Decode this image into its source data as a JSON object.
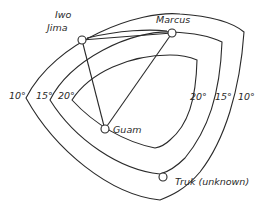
{
  "diagram": {
    "type": "isoline-map",
    "contours": [
      {
        "label": "10°",
        "left_label": "10°",
        "right_label": "10°"
      },
      {
        "label": "15°",
        "left_label": "15°",
        "right_label": "15°"
      },
      {
        "label": "20°",
        "left_label": "20°",
        "right_label": "20°"
      }
    ],
    "sites": [
      {
        "name": "Iwo Jima",
        "line1": "Iwo",
        "line2": "Jima"
      },
      {
        "name": "Marcus",
        "line1": "Marcus"
      },
      {
        "name": "Guam",
        "line1": "Guam"
      },
      {
        "name": "Truk (unknown)",
        "line1": "Truk (unknown)"
      }
    ],
    "connections": [
      [
        "Iwo Jima",
        "Marcus"
      ],
      [
        "Iwo Jima",
        "Guam"
      ],
      [
        "Marcus",
        "Guam"
      ]
    ],
    "colors": {
      "ink": "#2a2a2a",
      "background": "#ffffff"
    }
  }
}
